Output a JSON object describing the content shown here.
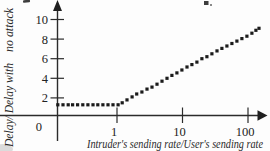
{
  "figure": {
    "background": "#fdfdfd",
    "ink": "#222222"
  },
  "chart_data": {
    "type": "scatter",
    "marker": "square-dot",
    "title": "",
    "xlabel": "Intruder's sending rate/User's sending rate",
    "ylabel": "Delay/ Delay with no attack",
    "ylabel_parts": [
      "Delay/ Delay with",
      "no attack"
    ],
    "x_scale": "log",
    "xlim": [
      0.115,
      155
    ],
    "ylim": [
      0,
      11
    ],
    "x_ticks": [
      1,
      10,
      100
    ],
    "x_tick_labels": [
      "1",
      "10",
      "100"
    ],
    "y_ticks": [
      2,
      4,
      6,
      8,
      10
    ],
    "y_tick_labels": [
      "2",
      "4",
      "6",
      "8",
      "10"
    ],
    "origin_label": "0",
    "grid": false,
    "legend": null,
    "points": [
      [
        0.125,
        1.3
      ],
      [
        0.15,
        1.3
      ],
      [
        0.18,
        1.3
      ],
      [
        0.21,
        1.3
      ],
      [
        0.25,
        1.3
      ],
      [
        0.3,
        1.3
      ],
      [
        0.36,
        1.3
      ],
      [
        0.43,
        1.3
      ],
      [
        0.51,
        1.3
      ],
      [
        0.61,
        1.3
      ],
      [
        0.73,
        1.3
      ],
      [
        0.87,
        1.3
      ],
      [
        1.04,
        1.3
      ],
      [
        1.2,
        1.5
      ],
      [
        1.42,
        1.8
      ],
      [
        1.7,
        2.1
      ],
      [
        2.0,
        2.4
      ],
      [
        2.4,
        2.6
      ],
      [
        2.87,
        2.9
      ],
      [
        3.42,
        3.1
      ],
      [
        4.08,
        3.4
      ],
      [
        4.86,
        3.7
      ],
      [
        5.8,
        4.0
      ],
      [
        6.9,
        4.3
      ],
      [
        8.2,
        4.55
      ],
      [
        9.8,
        4.85
      ],
      [
        11.7,
        5.15
      ],
      [
        13.9,
        5.4
      ],
      [
        16.6,
        5.65
      ],
      [
        19.8,
        6.0
      ],
      [
        23.6,
        6.2
      ],
      [
        28.1,
        6.5
      ],
      [
        33.6,
        6.8
      ],
      [
        40.0,
        7.05
      ],
      [
        47.7,
        7.3
      ],
      [
        56.8,
        7.55
      ],
      [
        67.8,
        7.8
      ],
      [
        80.8,
        8.05
      ],
      [
        96.3,
        8.3
      ],
      [
        114.8,
        8.6
      ],
      [
        132.0,
        8.9
      ],
      [
        147.0,
        9.1
      ]
    ]
  }
}
